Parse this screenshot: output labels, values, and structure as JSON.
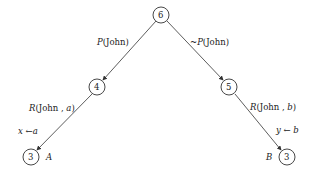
{
  "nodes": [
    {
      "id": "root",
      "label": "6"
    },
    {
      "id": "left",
      "label": "4"
    },
    {
      "id": "right",
      "label": "5"
    },
    {
      "id": "left-leaf",
      "label": "3",
      "tag": "A"
    },
    {
      "id": "right-leaf",
      "label": "3",
      "tag": "B"
    }
  ],
  "edges": {
    "root_left": {
      "pred": "P",
      "args": "(John)"
    },
    "root_right": {
      "neg": "~",
      "pred": "P",
      "args": "(John)"
    },
    "left_leaf": {
      "pred": "R",
      "args_pre": "(John , ",
      "var": "a",
      "close": ")"
    },
    "right_leaf": {
      "pred": "R",
      "args_pre": "(John , ",
      "var": "b",
      "close": ")"
    }
  },
  "substitutions": {
    "left": {
      "var": "x",
      "arrow": "←",
      "value": "a"
    },
    "right": {
      "var": "y",
      "arrow": "←",
      "value": "b"
    }
  },
  "colors": {
    "line": "#333333",
    "text": "#222222"
  }
}
